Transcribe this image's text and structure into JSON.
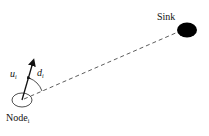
{
  "diagram": {
    "sink": {
      "label": "Sink",
      "color": "#000000"
    },
    "node": {
      "label": "Node",
      "subscript": "i"
    },
    "velocity": {
      "label": "u",
      "subscript": "i"
    },
    "angle": {
      "label": "d",
      "subscript": "i"
    },
    "connection": {
      "style": "dashed",
      "from": "node",
      "to": "sink"
    }
  }
}
